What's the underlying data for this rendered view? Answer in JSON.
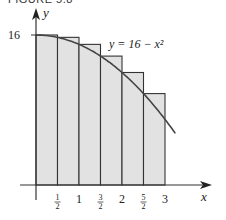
{
  "figure": {
    "caption": "FIGURE 5.8",
    "curve_label": "y = 16 − x²",
    "y_axis_label": "y",
    "x_axis_label": "x",
    "y_tick_label": "16",
    "colors": {
      "fill": "#e2e2e2",
      "stroke": "#333333",
      "curve": "#444444"
    }
  },
  "chart_data": {
    "type": "bar",
    "title": "FIGURE 5.8",
    "function": "y = 16 - x^2",
    "method": "left-endpoint rectangles (upper sum)",
    "x_interval": [
      0,
      3
    ],
    "delta_x": 0.5,
    "categories": [
      "0–1/2",
      "1/2–1",
      "1–3/2",
      "3/2–2",
      "2–5/2",
      "5/2–3"
    ],
    "values": [
      16,
      15.75,
      15,
      13.75,
      12,
      9.75
    ],
    "x_tick_labels": [
      "1/2",
      "1",
      "3/2",
      "2",
      "5/2",
      "3"
    ],
    "y_tick_labels": [
      "16"
    ],
    "xlabel": "x",
    "ylabel": "y",
    "xlim": [
      0,
      4
    ],
    "ylim": [
      0,
      17
    ],
    "grid": false,
    "legend": "none",
    "annotations": [
      "y = 16 − x²"
    ]
  }
}
